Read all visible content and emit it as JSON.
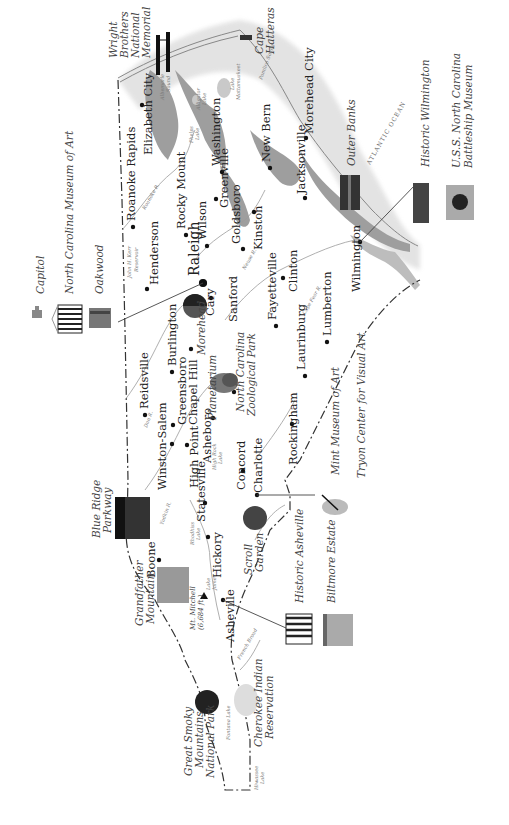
{
  "map": {
    "title": "North Carolina attractions map",
    "orientation": "rotated 90 degrees counter-clockwise",
    "colors": {
      "ink": "#222222",
      "water": "#9a9a9a",
      "background": "#ffffff",
      "border": "#333333"
    }
  },
  "cities": [
    {
      "id": "raleigh",
      "label": "Raleigh"
    },
    {
      "id": "cary",
      "label": "Cary"
    },
    {
      "id": "roanoke_rapids",
      "label": "Roanoke Rapids"
    },
    {
      "id": "elizabeth_city",
      "label": "Elizabeth City"
    },
    {
      "id": "rocky_mount",
      "label": "Rocky Mount"
    },
    {
      "id": "washington",
      "label": "Washington"
    },
    {
      "id": "henderson",
      "label": "Henderson"
    },
    {
      "id": "wilson",
      "label": "Wilson"
    },
    {
      "id": "greenville",
      "label": "Greenville"
    },
    {
      "id": "goldsboro",
      "label": "Goldsboro"
    },
    {
      "id": "kinston",
      "label": "Kinston"
    },
    {
      "id": "new_bern",
      "label": "New Bern"
    },
    {
      "id": "morehead_city",
      "label": "Morehead City"
    },
    {
      "id": "jacksonville",
      "label": "Jacksonville"
    },
    {
      "id": "wilmington",
      "label": "Wilmington"
    },
    {
      "id": "clinton",
      "label": "Clinton"
    },
    {
      "id": "lumberton",
      "label": "Lumberton"
    },
    {
      "id": "laurinburg",
      "label": "Laurinburg"
    },
    {
      "id": "fayetteville",
      "label": "Fayetteville"
    },
    {
      "id": "sanford",
      "label": "Sanford"
    },
    {
      "id": "reidsville",
      "label": "Reidsville"
    },
    {
      "id": "burlington",
      "label": "Burlington"
    },
    {
      "id": "greensboro",
      "label": "Greensboro"
    },
    {
      "id": "chapel_hill",
      "label": "Chapel Hill"
    },
    {
      "id": "asheboro",
      "label": "Asheboro"
    },
    {
      "id": "high_point",
      "label": "High Point"
    },
    {
      "id": "winston_salem",
      "label": "Winston-Salem"
    },
    {
      "id": "statesville",
      "label": "Statesville"
    },
    {
      "id": "concord",
      "label": "Concord"
    },
    {
      "id": "charlotte",
      "label": "Charlotte"
    },
    {
      "id": "rockingham",
      "label": "Rockingham"
    },
    {
      "id": "hickory",
      "label": "Hickory"
    },
    {
      "id": "boone",
      "label": "Boone"
    },
    {
      "id": "asheville",
      "label": "Asheville"
    }
  ],
  "attractions": {
    "capitol": "Capitol",
    "nc_museum_of_art": "North Carolina Museum of Art",
    "oakwood": "Oakwood",
    "wright_brothers": [
      "Wright",
      "Brothers",
      "National",
      "Memorial"
    ],
    "cape_hatteras": [
      "Cape",
      "Hatteras"
    ],
    "outer_banks": "Outer Banks",
    "historic_wilmington": "Historic Wilmington",
    "uss_nc": [
      "U.S.S. North Carolina",
      "Battleship Museum"
    ],
    "morehead_planetarium": [
      "Morehead",
      "Planetarium"
    ],
    "nc_zoo": [
      "North Carolina",
      "Zoological Park"
    ],
    "mint_museum": "Mint Museum of Art",
    "tryon_center": "Tryon Center for Visual Art",
    "blue_ridge": [
      "Blue Ridge",
      "Parkway"
    ],
    "grandfather_mountain": [
      "Grandfather",
      "Mountain"
    ],
    "mt_mitchell": [
      "Mt. Mitchell",
      "(6,684 ft.)"
    ],
    "scroll_garden": [
      "Scroll",
      "Garden"
    ],
    "historic_asheville": "Historic Asheville",
    "biltmore": "Biltmore Estate",
    "great_smoky": [
      "Great Smoky",
      "Mountains",
      "National Park"
    ],
    "cherokee": [
      "Cherokee Indian",
      "Reservation"
    ]
  },
  "water": {
    "atlantic": "ATLANTIC OCEAN",
    "roanoke_r": "Roanoke R.",
    "neuse_r": "Neuse R.",
    "cape_fear_r": "Cape Fear R.",
    "dan_r": "Dan R.",
    "yadkin_r": "Yadkin R.",
    "john_kerr": [
      "John H. Kerr",
      "Reservoir"
    ],
    "high_rock": [
      "High Rock",
      "Lake"
    ],
    "lake_norman": "Lake Norman",
    "rhodhiss": [
      "Rhodhiss",
      "Lake"
    ],
    "lake_james": [
      "Lake",
      "James"
    ],
    "fontana": "Fontana Lake",
    "hiwassee": [
      "Hiwassee",
      "Lake"
    ],
    "phelps": [
      "Phelps",
      "Lake"
    ],
    "alligator": [
      "Alligator",
      "Lake"
    ],
    "mattamuskeet": [
      "Lake",
      "Mattamuskeet"
    ],
    "albemarle": [
      "Albemarle",
      "Sound"
    ],
    "pamlico": "Pamlico Sound",
    "french_broad": "French Broad"
  }
}
